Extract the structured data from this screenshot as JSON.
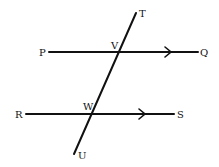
{
  "diagram": {
    "labels": {
      "T": "T",
      "P": "P",
      "V": "V",
      "Q": "Q",
      "R": "R",
      "W": "W",
      "S": "S",
      "U": "U"
    }
  }
}
